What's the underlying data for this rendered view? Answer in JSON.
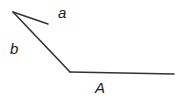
{
  "diagram": {
    "type": "angle-vectors",
    "labels": {
      "a": "a",
      "b": "b",
      "A": "A"
    },
    "colors": {
      "line": "#333333",
      "text": "#1a1a1a",
      "background": "#ffffff"
    }
  }
}
